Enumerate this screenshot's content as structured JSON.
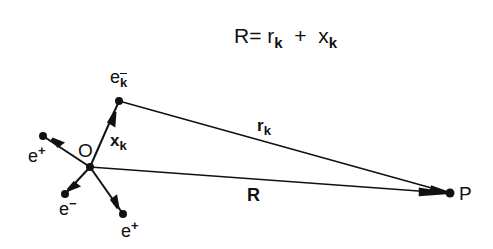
{
  "equation": {
    "lhs": "R",
    "equals": "=",
    "term1": "r",
    "term1_sub": "k",
    "plus": "+",
    "term2": "x",
    "term2_sub": "k"
  },
  "points": {
    "origin": {
      "label": "O",
      "x": 90,
      "y": 167
    },
    "P": {
      "label": "P",
      "x": 450,
      "y": 193
    },
    "ek": {
      "label": "e",
      "sub": "k",
      "sup": "−",
      "x": 119,
      "y": 101
    }
  },
  "particles": [
    {
      "label": "e",
      "sup": "+",
      "x": 43,
      "y": 136
    },
    {
      "label": "e",
      "sup": "−",
      "x": 65,
      "y": 194
    },
    {
      "label": "e",
      "sup": "+",
      "x": 123,
      "y": 214
    }
  ],
  "vectors": {
    "xk": {
      "label": "x",
      "sub": "k"
    },
    "rk": {
      "label": "r",
      "sub": "k"
    },
    "R": {
      "label": "R"
    }
  },
  "colors": {
    "ink": "#111111",
    "background": "#ffffff"
  }
}
